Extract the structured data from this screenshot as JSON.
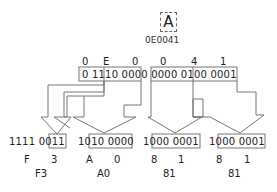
{
  "character": {
    "glyph": "A",
    "code_point": "0E0041"
  },
  "input": {
    "hex_digits": [
      "0",
      "E",
      "0",
      "0",
      "4",
      "1"
    ],
    "binary": "0 1110 0000 0000 0100 0001"
  },
  "output": {
    "bytes": [
      {
        "binary_prefix": "1111 0",
        "binary_payload": "011",
        "hex": [
          "F",
          "3"
        ],
        "byte": "F3"
      },
      {
        "binary_prefix": "10",
        "binary_payload": "10 0000",
        "hex": [
          "A",
          "0"
        ],
        "byte": "A0"
      },
      {
        "binary_prefix": "10",
        "binary_payload": "00 0001",
        "hex": [
          "8",
          "1"
        ],
        "byte": "81"
      },
      {
        "binary_prefix": "10",
        "binary_payload": "00 0001",
        "hex": [
          "8",
          "1"
        ],
        "byte": "81"
      }
    ]
  },
  "colors": {
    "line": "#777777",
    "text": "#222222",
    "background": "#ffffff"
  }
}
